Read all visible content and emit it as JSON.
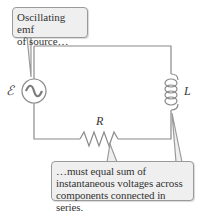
{
  "diagram": {
    "components": {
      "source": {
        "symbol": "ℰ",
        "type": "ac-source"
      },
      "resistor": {
        "symbol": "R",
        "type": "resistor"
      },
      "inductor": {
        "symbol": "L",
        "type": "inductor"
      }
    },
    "callouts": {
      "source": {
        "lines": [
          "Oscillating emf",
          "of source…"
        ]
      },
      "sum": {
        "lines": [
          "…must equal sum of",
          "instantaneous voltages across",
          "components connected in series."
        ]
      }
    },
    "colors": {
      "wire": "#8a8a8a",
      "callout_fill": "#efefef",
      "callout_border": "#9a9a9a",
      "text": "#333333"
    }
  }
}
